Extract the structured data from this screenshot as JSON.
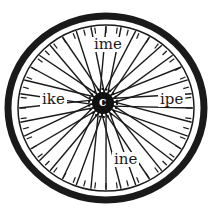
{
  "figure": {
    "type": "word-wheel",
    "hub_letter": "c",
    "words": {
      "top": "ime",
      "left": "ike",
      "right": "ipe",
      "bottom": "ine"
    },
    "spoke_count": 36,
    "colors": {
      "tire": "#1a1a1a",
      "spokes": "#1a1a1a",
      "hub": "#111111",
      "background": "#ffffff"
    }
  }
}
